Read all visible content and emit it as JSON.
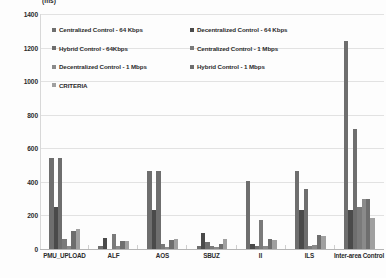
{
  "chart_data": {
    "type": "bar",
    "title": "",
    "subtitle": "",
    "xlabel": "",
    "ylabel": "",
    "unit_label": "(ms)",
    "ylim": [
      0,
      1400
    ],
    "ytick_step": 200,
    "yticks": [
      "1400",
      "1200",
      "1000",
      "800",
      "600",
      "400",
      "200",
      "0"
    ],
    "grid": true,
    "legend_position": "inside-top-left",
    "categories": [
      "PMU_UPLOAD",
      "ALF",
      "AOS",
      "SBUZ",
      "II",
      "ILS",
      "Inter-area Control"
    ],
    "series": [
      {
        "name": "Centralized Control - 64 Kbps",
        "color": "#6e6e6e",
        "values": [
          540,
          15,
          465,
          15,
          405,
          465,
          1240
        ]
      },
      {
        "name": "Decentralized Control - 64 Kbps",
        "color": "#4a4a4a",
        "values": [
          250,
          65,
          235,
          95,
          30,
          235,
          235
        ]
      },
      {
        "name": "Hybrid Control - 64Kbps",
        "color": "#6e6e6e",
        "values": [
          540,
          0,
          465,
          40,
          15,
          360,
          715
        ]
      },
      {
        "name": "Centralized Control - 1 Mbps",
        "color": "#7a7a7a",
        "values": [
          60,
          90,
          30,
          20,
          175,
          15,
          250
        ]
      },
      {
        "name": "Decentralized Control - 1 Mbps",
        "color": "#8a8a8a",
        "values": [
          15,
          15,
          10,
          10,
          20,
          25,
          300
        ]
      },
      {
        "name": "Hybrid Control - 1 Mbps",
        "color": "#6e6e6e",
        "values": [
          110,
          50,
          55,
          30,
          60,
          85,
          300
        ]
      },
      {
        "name": "CRITERIA",
        "color": "#a0a0a0",
        "values": [
          120,
          50,
          60,
          60,
          55,
          75,
          185
        ]
      }
    ]
  },
  "legend": {
    "items": [
      {
        "label": "Centralized Control - 64 Kbps",
        "color": "#6e6e6e"
      },
      {
        "label": "Decentralized Control - 64 Kbps",
        "color": "#4a4a4a"
      },
      {
        "label": "Hybrid Control - 64Kbps",
        "color": "#6e6e6e"
      },
      {
        "label": "Centralized Control - 1 Mbps",
        "color": "#7a7a7a"
      },
      {
        "label": "Decentralized Control - 1 Mbps",
        "color": "#8a8a8a"
      },
      {
        "label": "Hybrid Control - 1 Mbps",
        "color": "#6e6e6e"
      },
      {
        "label": "CRITERIA",
        "color": "#a0a0a0"
      }
    ]
  }
}
